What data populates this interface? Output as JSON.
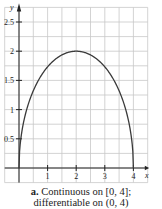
{
  "chart_data": {
    "type": "line",
    "title": "",
    "xlabel": "x",
    "ylabel": "y",
    "xlim": [
      -0.5,
      4.5
    ],
    "ylim": [
      -0.25,
      2.75
    ],
    "grid": true,
    "x_ticks": [
      1,
      2,
      3,
      4
    ],
    "x_tick_labels": [
      "1",
      "2",
      "3",
      "4"
    ],
    "y_ticks": [
      0.5,
      1,
      1.5,
      2,
      2.5
    ],
    "y_tick_labels": [
      "0.5",
      "1",
      "1.5",
      "2",
      "2.5"
    ],
    "series": [
      {
        "name": "f(x) = sqrt(4x - x^2)",
        "x": [
          0,
          0.05,
          0.25,
          0.5,
          1,
          1.5,
          2,
          2.5,
          3,
          3.5,
          3.75,
          3.95,
          4
        ],
        "y": [
          0,
          0.44,
          0.97,
          1.32,
          1.73,
          1.94,
          2.0,
          1.94,
          1.73,
          1.32,
          0.97,
          0.44,
          0
        ]
      }
    ],
    "annotations": []
  },
  "caption": {
    "label": "a.",
    "line1": "Continuous on [0, 4];",
    "line2": "differentiable on (0, 4)"
  },
  "colors": {
    "grid": "#c8c8c8",
    "axis": "#222222",
    "curve": "#3a3a3a"
  }
}
